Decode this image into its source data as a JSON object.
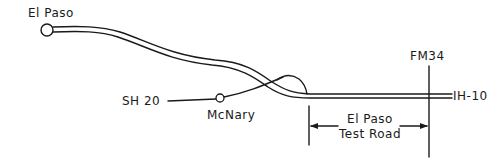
{
  "diagram": {
    "type": "route-map",
    "labels": {
      "el_paso": "El Paso",
      "sh20": "SH 20",
      "mcnary": "McNary",
      "fm34": "FM34",
      "ih10": "IH-10",
      "test_road_line1": "El Paso",
      "test_road_line2": "Test Road"
    },
    "nodes": [
      {
        "id": "el-paso",
        "label": "El Paso",
        "kind": "city-circle"
      },
      {
        "id": "mcnary",
        "label": "McNary",
        "kind": "town-circle"
      }
    ],
    "roads": [
      {
        "id": "ih-10",
        "label": "IH-10",
        "style": "double-line",
        "from": "El Paso",
        "to": "east"
      },
      {
        "id": "sh-20",
        "label": "SH 20",
        "style": "single-line",
        "via": "McNary"
      },
      {
        "id": "fm-34",
        "label": "FM34",
        "style": "single-line",
        "orientation": "vertical"
      }
    ],
    "segment": {
      "label": "El Paso Test Road",
      "from": "interchange east of McNary",
      "to": "FM34"
    },
    "colors": {
      "line": "#1a1a1a",
      "background": "#ffffff"
    }
  }
}
